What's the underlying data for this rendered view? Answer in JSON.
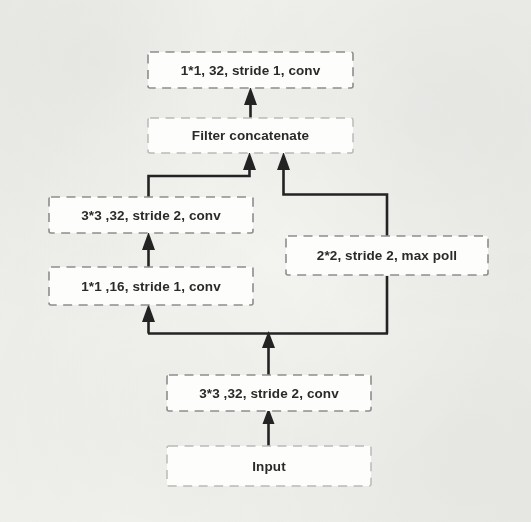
{
  "figure": {
    "background_color": "#f7f7f5",
    "box_stroke_color": "#8d8d8d",
    "box_fill_color": "#fdfdfc",
    "arrow_color": "#232323",
    "text_color": "#2a2a2a"
  },
  "nodes": {
    "top_conv": {
      "label": "1*1, 32,  stride 1,  conv"
    },
    "filter_concat": {
      "label": "Filter concatenate"
    },
    "left_conv_3x3": {
      "label": "3*3 ,32,  stride 2,  conv"
    },
    "left_conv_1x1": {
      "label": "1*1 ,16,  stride 1,  conv"
    },
    "right_maxpool": {
      "label": "2*2, stride 2,  max poll"
    },
    "stem_conv_3x3": {
      "label": "3*3 ,32,  stride 2,  conv"
    },
    "input": {
      "label": "Input"
    }
  },
  "edges": [
    {
      "name": "input-to-stem",
      "from": "input",
      "to": "stem_conv_3x3"
    },
    {
      "name": "stem-to-split",
      "from": "stem_conv_3x3",
      "to": "split_bus"
    },
    {
      "name": "split-to-left-1x1",
      "from": "split_bus",
      "to": "left_conv_1x1"
    },
    {
      "name": "split-to-maxpool",
      "from": "split_bus",
      "to": "right_maxpool"
    },
    {
      "name": "left-1x1-to-3x3",
      "from": "left_conv_1x1",
      "to": "left_conv_3x3"
    },
    {
      "name": "left-3x3-to-concat",
      "from": "left_conv_3x3",
      "to": "filter_concat"
    },
    {
      "name": "maxpool-to-concat",
      "from": "right_maxpool",
      "to": "filter_concat"
    },
    {
      "name": "concat-to-top-conv",
      "from": "filter_concat",
      "to": "top_conv"
    }
  ]
}
